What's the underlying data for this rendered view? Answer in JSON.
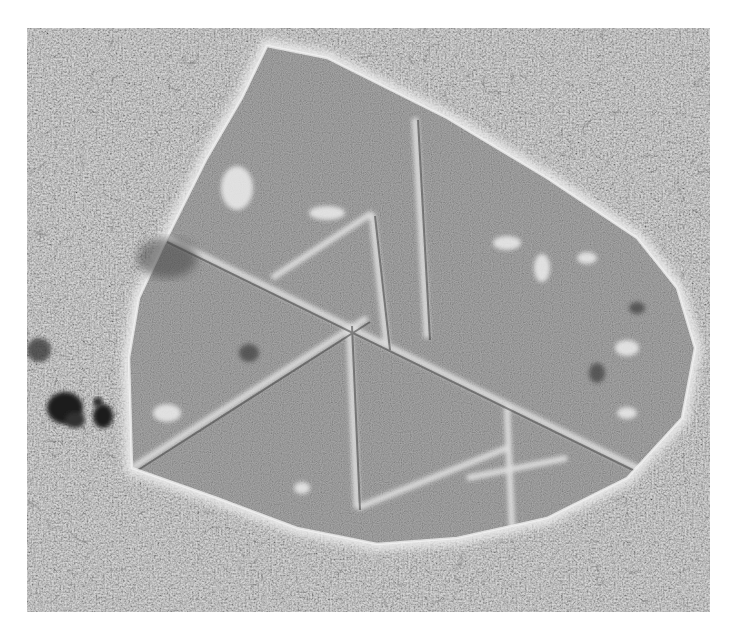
{
  "image": {
    "kind": "grayscale micrograph",
    "subject": "polygonal crystalline flake with internal ridges on a textured substrate",
    "background_color": "#ffffff",
    "substrate_tone": "#a8a8a8",
    "flake_tone": "#8f8f8f",
    "ridge_tone": "#e6e6e6",
    "particle_tone": "#1e1e1e",
    "frame": {
      "x": 27,
      "y": 28,
      "width": 683,
      "height": 584
    }
  }
}
